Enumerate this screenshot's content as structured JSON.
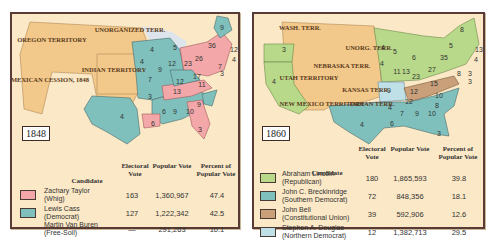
{
  "colors": {
    "background": "#ffffff",
    "panel_bg": "#fbe8c6",
    "panel_border": "#5a3a34",
    "territory": "#f2c98a",
    "water": "#d9e3ef",
    "whig": "#f3a7a9",
    "democrat_1848": "#7fc0bd",
    "republican": "#b9d98a",
    "southern_democrat": "#7fc0bd",
    "constitutional_union": "#c9a07a",
    "northern_democrat": "#bfe0e6"
  },
  "panels": [
    {
      "year": "1848",
      "map": {
        "territories": [
          "OREGON TERRITORY",
          "UNORGANIZED TERR.",
          "MEXICAN CESSION, 1848",
          "INDIAN TERRITORY"
        ],
        "state_votes": [
          "9",
          "6",
          "6",
          "12",
          "36",
          "4",
          "6",
          "26",
          "7",
          "8",
          "3",
          "4",
          "5",
          "4",
          "9",
          "12",
          "23",
          "17",
          "7",
          "12",
          "11",
          "13",
          "3",
          "9",
          "6",
          "9",
          "10",
          "4",
          "6",
          "3"
        ]
      },
      "legend": {
        "headers": {
          "candidate": "Candidate",
          "electoral": "Electoral Vote",
          "popular": "Popular Vote",
          "percent": "Percent of Popular Vote"
        },
        "rows": [
          {
            "name": "Zachary Taylor",
            "party": "(Whig)",
            "electoral": "163",
            "popular": "1,360,967",
            "percent": "47.4",
            "swatch": "#f3a7a9"
          },
          {
            "name": "Lewis Cass",
            "party": "(Democrat)",
            "electoral": "127",
            "popular": "1,222,342",
            "percent": "42.5",
            "swatch": "#7fc0bd"
          },
          {
            "name": "Martin Van Buren",
            "party": "(Free-Soil)",
            "electoral": "—",
            "popular": "291,263",
            "percent": "10.1",
            "swatch": null
          }
        ]
      }
    },
    {
      "year": "1860",
      "map": {
        "territories": [
          "WASH. TERR.",
          "UNORG. TERR.",
          "NEBRASKA TERR.",
          "UTAH TERRITORY",
          "KANSAS TERR.",
          "NEW MEXICO TERRITORY",
          "INDIAN TERR."
        ],
        "state_votes": [
          "8",
          "5",
          "5",
          "13",
          "35",
          "4",
          "6",
          "27",
          "4",
          "3",
          "8",
          "3",
          "3",
          "4",
          "5",
          "6",
          "4",
          "11",
          "13",
          "23",
          "9",
          "15",
          "12",
          "12",
          "10",
          "8",
          "4",
          "7",
          "9",
          "10",
          "6",
          "4",
          "4",
          "3"
        ]
      },
      "legend": {
        "headers": {
          "candidate": "Candidate",
          "electoral": "Electoral Vote",
          "popular": "Popular Vote",
          "percent": "Percent of Popular Vote"
        },
        "rows": [
          {
            "name": "Abraham Lincoln",
            "party": "(Republican)",
            "electoral": "180",
            "popular": "1,865,593",
            "percent": "39.8",
            "swatch": "#b9d98a"
          },
          {
            "name": "John C. Breckinridge",
            "party": "(Southern Democrat)",
            "electoral": "72",
            "popular": "848,356",
            "percent": "18.1",
            "swatch": "#7fc0bd"
          },
          {
            "name": "John Bell",
            "party": "(Constitutional Union)",
            "electoral": "39",
            "popular": "592,906",
            "percent": "12.6",
            "swatch": "#c9a07a"
          },
          {
            "name": "Stephen A. Douglas",
            "party": "(Northern Democrat)",
            "electoral": "12",
            "popular": "1,382,713",
            "percent": "29.5",
            "swatch": "#bfe0e6"
          }
        ]
      }
    }
  ]
}
